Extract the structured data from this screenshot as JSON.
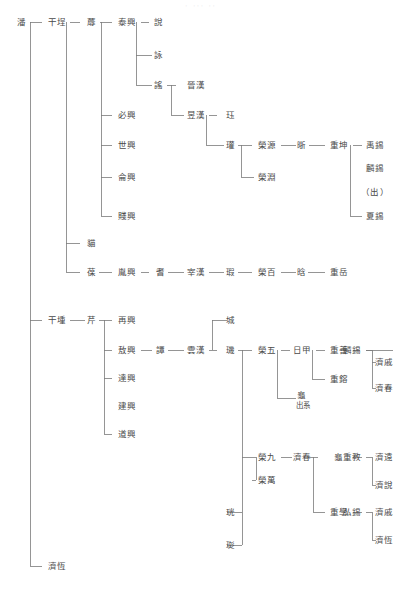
{
  "document": {
    "title": "潘氏家系圖",
    "header_faint": "·  ···  ··"
  },
  "chart_data": {
    "type": "diagram",
    "orientation": "left-to-right",
    "generations": 10,
    "nodes": [
      {
        "id": "n1",
        "label": "潘",
        "x": 22,
        "y": 22,
        "gen": 0
      },
      {
        "id": "n2",
        "label": "干埕",
        "x": 57,
        "y": 22,
        "gen": 1
      },
      {
        "id": "n3",
        "label": "蓐",
        "x": 92,
        "y": 22,
        "gen": 2
      },
      {
        "id": "n4",
        "label": "泰興",
        "x": 127,
        "y": 22,
        "gen": 3
      },
      {
        "id": "n5",
        "label": "說",
        "x": 159,
        "y": 22,
        "gen": 4
      },
      {
        "id": "n6",
        "label": "詠",
        "x": 159,
        "y": 55,
        "gen": 4
      },
      {
        "id": "n7",
        "label": "謠",
        "x": 159,
        "y": 85,
        "gen": 4
      },
      {
        "id": "n8",
        "label": "晉漢",
        "x": 196,
        "y": 85,
        "gen": 5
      },
      {
        "id": "n9",
        "label": "昱漢",
        "x": 196,
        "y": 115,
        "gen": 5
      },
      {
        "id": "n10",
        "label": "珏",
        "x": 231,
        "y": 115,
        "gen": 6
      },
      {
        "id": "n11",
        "label": "瓘",
        "x": 231,
        "y": 145,
        "gen": 6
      },
      {
        "id": "n12",
        "label": "榮源",
        "x": 267,
        "y": 145,
        "gen": 7
      },
      {
        "id": "n13",
        "label": "榮淵",
        "x": 267,
        "y": 177,
        "gen": 7
      },
      {
        "id": "n14",
        "label": "晣",
        "x": 302,
        "y": 145,
        "gen": 8
      },
      {
        "id": "n15",
        "label": "重坤",
        "x": 339,
        "y": 145,
        "gen": 9
      },
      {
        "id": "n16",
        "label": "禹錫",
        "x": 375,
        "y": 145,
        "gen": 10
      },
      {
        "id": "n17",
        "label": "麟錫",
        "x": 375,
        "y": 168,
        "gen": 10
      },
      {
        "id": "n18",
        "label": "（出）",
        "x": 375,
        "y": 192,
        "gen": 10
      },
      {
        "id": "n19",
        "label": "夏錫",
        "x": 375,
        "y": 216,
        "gen": 10
      },
      {
        "id": "n20",
        "label": "必興",
        "x": 127,
        "y": 115,
        "gen": 3
      },
      {
        "id": "n21",
        "label": "世興",
        "x": 127,
        "y": 145,
        "gen": 3
      },
      {
        "id": "n22",
        "label": "侖興",
        "x": 127,
        "y": 177,
        "gen": 3
      },
      {
        "id": "n23",
        "label": "賤興",
        "x": 127,
        "y": 216,
        "gen": 3
      },
      {
        "id": "n24",
        "label": "貓",
        "x": 92,
        "y": 243,
        "gen": 2
      },
      {
        "id": "n25",
        "label": "葆",
        "x": 92,
        "y": 272,
        "gen": 2
      },
      {
        "id": "n26",
        "label": "胤興",
        "x": 127,
        "y": 272,
        "gen": 3
      },
      {
        "id": "n27",
        "label": "耆",
        "x": 161,
        "y": 272,
        "gen": 4
      },
      {
        "id": "n28",
        "label": "宰漢",
        "x": 196,
        "y": 272,
        "gen": 5
      },
      {
        "id": "n29",
        "label": "瑕",
        "x": 231,
        "y": 272,
        "gen": 6
      },
      {
        "id": "n30",
        "label": "榮百",
        "x": 267,
        "y": 272,
        "gen": 7
      },
      {
        "id": "n31",
        "label": "晗",
        "x": 302,
        "y": 272,
        "gen": 8
      },
      {
        "id": "n32",
        "label": "重岳",
        "x": 339,
        "y": 272,
        "gen": 9
      },
      {
        "id": "n33",
        "label": "干堹",
        "x": 57,
        "y": 320,
        "gen": 1
      },
      {
        "id": "n34",
        "label": "芹",
        "x": 92,
        "y": 320,
        "gen": 2
      },
      {
        "id": "n35",
        "label": "再興",
        "x": 127,
        "y": 320,
        "gen": 3
      },
      {
        "id": "n36",
        "label": "敖興",
        "x": 127,
        "y": 350,
        "gen": 3
      },
      {
        "id": "n37",
        "label": "達興",
        "x": 127,
        "y": 378,
        "gen": 3
      },
      {
        "id": "n38",
        "label": "建興",
        "x": 127,
        "y": 406,
        "gen": 3
      },
      {
        "id": "n39",
        "label": "道興",
        "x": 127,
        "y": 434,
        "gen": 3
      },
      {
        "id": "n40",
        "label": "譚",
        "x": 161,
        "y": 350,
        "gen": 4
      },
      {
        "id": "n41",
        "label": "雲漢",
        "x": 196,
        "y": 350,
        "gen": 5
      },
      {
        "id": "n42",
        "label": "城",
        "x": 231,
        "y": 320,
        "gen": 6
      },
      {
        "id": "n43",
        "label": "璣",
        "x": 231,
        "y": 350,
        "gen": 6
      },
      {
        "id": "n44",
        "label": "珖",
        "x": 231,
        "y": 512,
        "gen": 6
      },
      {
        "id": "n45",
        "label": "珳",
        "x": 231,
        "y": 545,
        "gen": 6
      },
      {
        "id": "n46",
        "label": "榮五",
        "x": 267,
        "y": 350,
        "gen": 7
      },
      {
        "id": "n47",
        "label": "榮九",
        "x": 267,
        "y": 457,
        "gen": 7
      },
      {
        "id": "n48",
        "label": "榮萬",
        "x": 267,
        "y": 480,
        "gen": 7
      },
      {
        "id": "n49",
        "label": "日甲",
        "x": 302,
        "y": 350,
        "gen": 8
      },
      {
        "id": "n50",
        "label": "龜",
        "x": 302,
        "y": 395,
        "gen": 8,
        "note": "出系"
      },
      {
        "id": "n50b",
        "label": "出系",
        "x": 302,
        "y": 405,
        "gen": 8
      },
      {
        "id": "n51",
        "label": "重善",
        "x": 339,
        "y": 350,
        "gen": 9
      },
      {
        "id": "n52",
        "label": "重鎔",
        "x": 339,
        "y": 379,
        "gen": 9
      },
      {
        "id": "n53",
        "label": "麟錫",
        "x": 375,
        "y": 350,
        "gen": 10
      },
      {
        "id": "n54",
        "label": "濟戚",
        "x": 375,
        "y": 362,
        "gen": 11
      },
      {
        "id": "n55",
        "label": "濟春",
        "x": 375,
        "y": 388,
        "gen": 11
      },
      {
        "id": "n56",
        "label": "龜",
        "x": 302,
        "y": 457,
        "gen": 8
      },
      {
        "id": "n57",
        "label": "重學",
        "x": 339,
        "y": 457,
        "gen": 9
      },
      {
        "id": "n58",
        "label": "重教",
        "x": 339,
        "y": 512,
        "gen": 9
      },
      {
        "id": "n59",
        "label": "弘錫",
        "x": 375,
        "y": 457,
        "gen": 10
      },
      {
        "id": "n60",
        "label": "毅錫",
        "x": 375,
        "y": 512,
        "gen": 10
      },
      {
        "id": "n61",
        "label": "濟遠",
        "x": 375,
        "y": 457,
        "gen": 11
      },
      {
        "id": "n62",
        "label": "濟說",
        "x": 375,
        "y": 485,
        "gen": 11
      },
      {
        "id": "n63",
        "label": "濟戚",
        "x": 375,
        "y": 512,
        "gen": 11
      },
      {
        "id": "n64",
        "label": "濟恆",
        "x": 375,
        "y": 540,
        "gen": 11
      },
      {
        "id": "n65",
        "label": "之翺",
        "x": 57,
        "y": 566,
        "gen": 1
      }
    ],
    "labels_in_reading_order": [
      "潘",
      "干埕",
      "蓐",
      "泰興",
      "說",
      "詠",
      "謠",
      "晉漢",
      "昱漢",
      "珏",
      "瓘",
      "榮源",
      "榮淵",
      "晣",
      "重坤",
      "禹錫",
      "麟錫",
      "（出）",
      "夏錫",
      "必興",
      "世興",
      "侖興",
      "賤興",
      "貓",
      "葆",
      "胤興",
      "耆",
      "宰漢",
      "瑕",
      "榮百",
      "晗",
      "重岳",
      "干堹",
      "芹",
      "再興",
      "敖興",
      "達興",
      "建興",
      "道興",
      "譚",
      "雲漢",
      "城",
      "璣",
      "榮五",
      "日甲",
      "重善",
      "麟錫",
      "濟戚",
      "濟春",
      "重鎔",
      "龜",
      "出系",
      "榮九",
      "龜",
      "重學",
      "弘錫",
      "濟遠",
      "濟說",
      "重教",
      "毅錫",
      "濟戚",
      "濟恆",
      "榮萬",
      "珖",
      "珳",
      "之翺"
    ],
    "line_color": "#7a7a7a",
    "text_color": "#4a4a4a",
    "background": "#ffffff"
  }
}
